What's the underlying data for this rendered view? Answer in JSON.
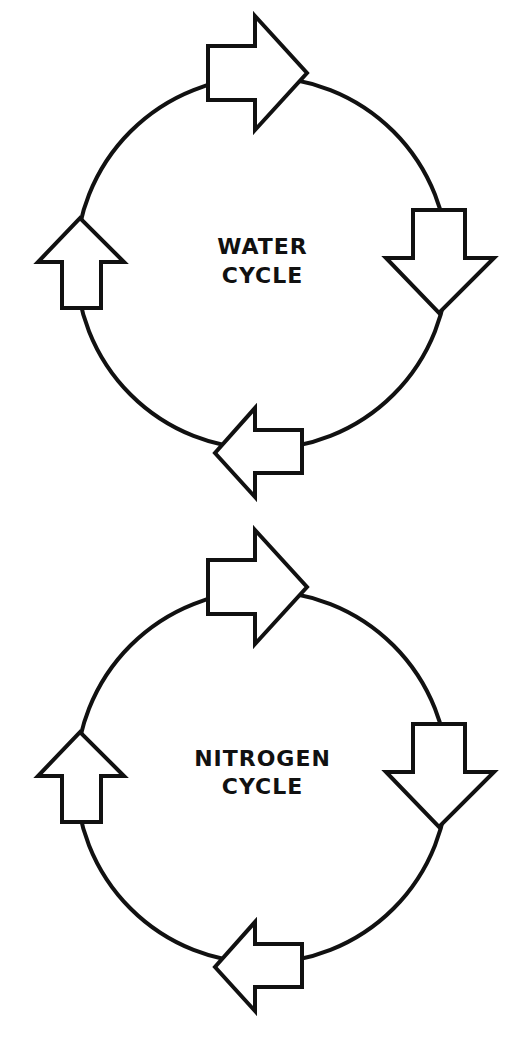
{
  "colors": {
    "stroke": "#111111",
    "background": "#ffffff",
    "arrow_fill": "#ffffff"
  },
  "diagrams": [
    {
      "title_line1": "WATER",
      "title_line2": "CYCLE",
      "arrows": [
        "right",
        "down",
        "left",
        "up"
      ]
    },
    {
      "title_line1": "NITROGEN",
      "title_line2": "CYCLE",
      "arrows": [
        "right",
        "down",
        "left",
        "up"
      ]
    }
  ]
}
